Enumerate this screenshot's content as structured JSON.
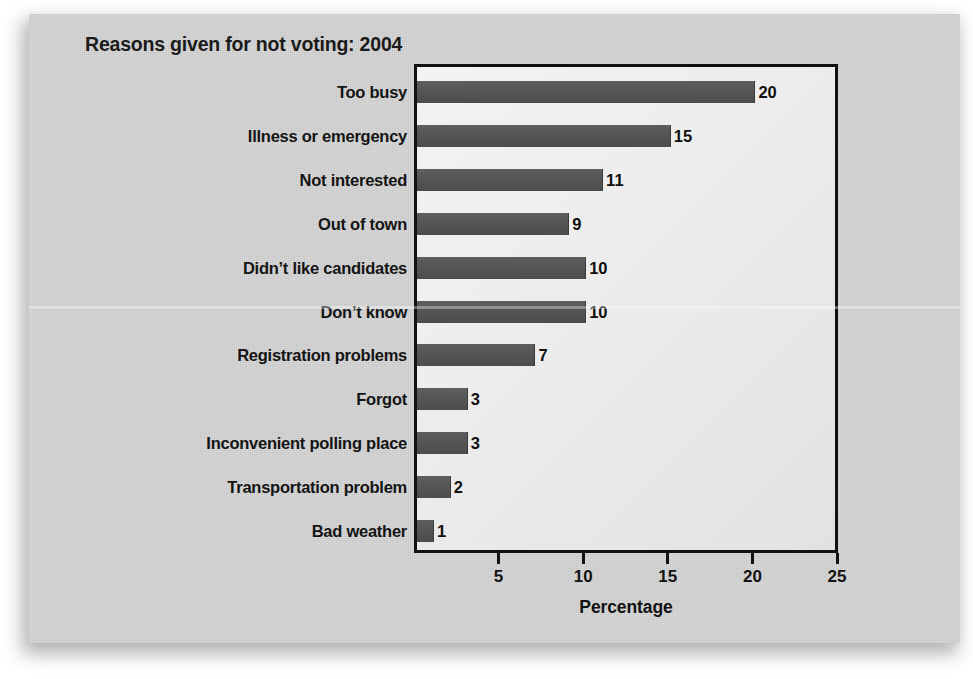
{
  "chart_data": {
    "type": "bar",
    "orientation": "horizontal",
    "title": "Reasons given for not voting: 2004",
    "xlabel": "Percentage",
    "ylabel": "",
    "xlim": [
      0,
      25
    ],
    "xticks": [
      5,
      10,
      15,
      20,
      25
    ],
    "xtick_labels": [
      "5",
      "10",
      "15",
      "20",
      "25"
    ],
    "grid": false,
    "legend": false,
    "categories": [
      "Too busy",
      "Illness or emergency",
      "Not interested",
      "Out of town",
      "Didn’t like candidates",
      "Don’t know",
      "Registration problems",
      "Forgot",
      "Inconvenient polling place",
      "Transportation problem",
      "Bad weather"
    ],
    "values": [
      20,
      15,
      11,
      9,
      10,
      10,
      7,
      3,
      3,
      2,
      1
    ],
    "value_labels": [
      "20",
      "15",
      "11",
      "9",
      "10",
      "10",
      "7",
      "3",
      "3",
      "2",
      "1"
    ],
    "bar_color": "#565656",
    "plot_background": "#ececec",
    "card_background": "#cdcdcd",
    "frame_color": "#111111",
    "text_color": "#141414"
  }
}
